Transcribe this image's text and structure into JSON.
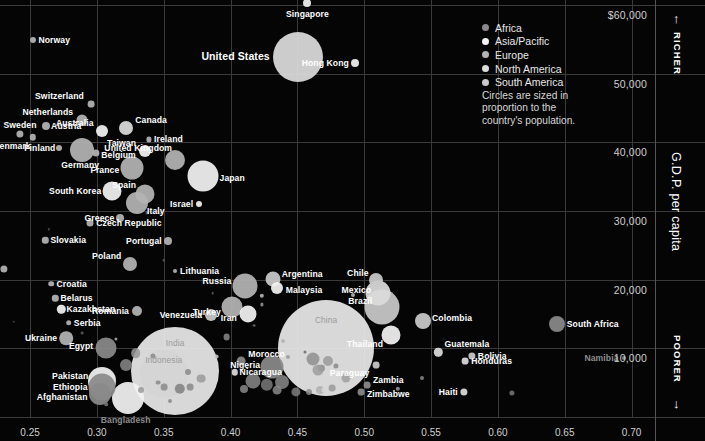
{
  "chart_data": {
    "type": "scatter",
    "title": "",
    "xlabel": "",
    "ylabel": "G.D.P. per capita",
    "xlim": [
      0.2275,
      0.7175
    ],
    "ylim": [
      0,
      60700
    ],
    "grid": true,
    "xticks": [
      0.25,
      0.3,
      0.35,
      0.4,
      0.45,
      0.5,
      0.55,
      0.6,
      0.65,
      0.7
    ],
    "xtick_labels": [
      "0.25",
      "0.30",
      "0.35",
      "0.40",
      "0.45",
      "0.50",
      "0.55",
      "0.60",
      "0.65",
      "0.70"
    ],
    "yticks": [
      60000,
      50000,
      40000,
      30000,
      20000,
      10000
    ],
    "ytick_labels": [
      "$60,000",
      "50,000",
      "40,000",
      "30,000",
      "20,000",
      "10,000"
    ],
    "y_axis_caption_top": "RICHER",
    "y_axis_caption_bottom": "POORER",
    "arrow_up": "↑",
    "arrow_down": "↓",
    "size_note": "Circles are sized in proportion to the country's population.",
    "legend_position": "top-right",
    "legend": [
      {
        "label": "Africa",
        "color": "#8a8a8a"
      },
      {
        "label": "Asia/Pacific",
        "color": "#f2f2f2"
      },
      {
        "label": "Europe",
        "color": "#b4b4b4"
      },
      {
        "label": "North America",
        "color": "#dcdcdc"
      },
      {
        "label": "South America",
        "color": "#c9c9c9"
      }
    ],
    "points": [
      {
        "name": "Singapore",
        "x": 0.4575,
        "y": 60200,
        "r": 4.0,
        "color": "#f2f2f2",
        "lx": 0,
        "ly": 11,
        "la": "c"
      },
      {
        "name": "Norway",
        "x": 0.2525,
        "y": 54900,
        "r": 3.0,
        "color": "#b4b4b4",
        "lx": 5,
        "ly": 0,
        "la": "l"
      },
      {
        "name": "United States",
        "x": 0.4503,
        "y": 52400,
        "r": 25.0,
        "color": "#dcdcdc",
        "lx": -28,
        "ly": -1,
        "la": "r",
        "big": true
      },
      {
        "name": "Hong Kong",
        "x": 0.493,
        "y": 51500,
        "r": 4.0,
        "color": "#f2f2f2",
        "lx": -6,
        "ly": 0,
        "la": "r"
      },
      {
        "name": "Switzerland",
        "x": 0.2955,
        "y": 45500,
        "r": 3.4,
        "color": "#b4b4b4",
        "lx": -7,
        "ly": -8,
        "la": "r"
      },
      {
        "name": "Netherlands",
        "x": 0.289,
        "y": 43300,
        "r": 5.5,
        "color": "#b4b4b4",
        "lx": -9,
        "ly": -8,
        "la": "r"
      },
      {
        "name": "Austria",
        "x": 0.262,
        "y": 42300,
        "r": 4.0,
        "color": "#b4b4b4",
        "lx": 5,
        "ly": 0,
        "la": "l"
      },
      {
        "name": "Australia",
        "x": 0.3035,
        "y": 41700,
        "r": 6.0,
        "color": "#f2f2f2",
        "lx": -8,
        "ly": -8,
        "la": "r"
      },
      {
        "name": "Canada",
        "x": 0.322,
        "y": 42000,
        "r": 7.0,
        "color": "#dcdcdc",
        "lx": 9,
        "ly": -8,
        "la": "l"
      },
      {
        "name": "Sweden",
        "x": 0.2425,
        "y": 41200,
        "r": 3.6,
        "color": "#b4b4b4",
        "lx": 0,
        "ly": -9,
        "la": "c"
      },
      {
        "name": "Denmark",
        "x": 0.252,
        "y": 40700,
        "r": 3.2,
        "color": "#b4b4b4",
        "lx": -2,
        "ly": 9,
        "la": "r"
      },
      {
        "name": "Ireland",
        "x": 0.339,
        "y": 40400,
        "r": 2.6,
        "color": "#b4b4b4",
        "lx": 5,
        "ly": 0,
        "la": "l"
      },
      {
        "name": "Finland",
        "x": 0.272,
        "y": 39100,
        "r": 3.0,
        "color": "#b4b4b4",
        "lx": -4,
        "ly": 0,
        "la": "r"
      },
      {
        "name": "Germany",
        "x": 0.289,
        "y": 38800,
        "r": 12.0,
        "color": "#b4b4b4",
        "lx": -2,
        "ly": 15,
        "la": "c"
      },
      {
        "name": "Belgium",
        "x": 0.2995,
        "y": 38400,
        "r": 3.6,
        "color": "#b4b4b4",
        "lx": 5,
        "ly": 2,
        "la": "l"
      },
      {
        "name": "Taiwan",
        "x": 0.336,
        "y": 38700,
        "r": 6.0,
        "color": "#f2f2f2",
        "lx": -9,
        "ly": -8,
        "la": "r"
      },
      {
        "name": "United Kingdom",
        "x": 0.3585,
        "y": 37400,
        "r": 10.0,
        "color": "#b4b4b4",
        "lx": -3,
        "ly": -12,
        "la": "r"
      },
      {
        "name": "France",
        "x": 0.3265,
        "y": 36300,
        "r": 11.5,
        "color": "#b4b4b4",
        "lx": -13,
        "ly": 2,
        "la": "r"
      },
      {
        "name": "Japan",
        "x": 0.379,
        "y": 35100,
        "r": 15.5,
        "color": "#f2f2f2",
        "lx": 17,
        "ly": 2,
        "la": "l"
      },
      {
        "name": "South Korea",
        "x": 0.3115,
        "y": 32900,
        "r": 9.5,
        "color": "#f2f2f2",
        "lx": -11,
        "ly": 0,
        "la": "r"
      },
      {
        "name": "Spain",
        "x": 0.336,
        "y": 32400,
        "r": 9.5,
        "color": "#b4b4b4",
        "lx": -9,
        "ly": -9,
        "la": "r"
      },
      {
        "name": "Italy",
        "x": 0.33,
        "y": 31100,
        "r": 11.0,
        "color": "#b4b4b4",
        "lx": 10,
        "ly": 8,
        "la": "l"
      },
      {
        "name": "Israel",
        "x": 0.3765,
        "y": 31000,
        "r": 3.0,
        "color": "#f2f2f2",
        "lx": -6,
        "ly": 0,
        "la": "r"
      },
      {
        "name": "Greece",
        "x": 0.3175,
        "y": 29000,
        "r": 4.0,
        "color": "#b4b4b4",
        "lx": -6,
        "ly": 0,
        "la": "r"
      },
      {
        "name": "Czech Republic",
        "x": 0.295,
        "y": 28300,
        "r": 3.5,
        "color": "#b4b4b4",
        "lx": 6,
        "ly": 0,
        "la": "l"
      },
      {
        "name": "Slovakia",
        "x": 0.2615,
        "y": 25700,
        "r": 3.2,
        "color": "#b4b4b4",
        "lx": 5,
        "ly": 0,
        "la": "l"
      },
      {
        "name": "Portugal",
        "x": 0.353,
        "y": 25600,
        "r": 4.0,
        "color": "#b4b4b4",
        "lx": -6,
        "ly": 0,
        "la": "r"
      },
      {
        "name": "Poland",
        "x": 0.325,
        "y": 22200,
        "r": 7.0,
        "color": "#b4b4b4",
        "lx": -9,
        "ly": -8,
        "la": "r"
      },
      {
        "name": "Hungary",
        "x": 0.2305,
        "y": 21500,
        "r": 3.6,
        "color": "#b4b4b4",
        "lx": -5,
        "ly": 0,
        "la": "r"
      },
      {
        "name": "Lithuania",
        "x": 0.3585,
        "y": 21300,
        "r": 2.0,
        "color": "#b4b4b4",
        "lx": 5,
        "ly": 0,
        "la": "l"
      },
      {
        "name": "Argentina",
        "x": 0.4315,
        "y": 20100,
        "r": 7.5,
        "color": "#c9c9c9",
        "lx": 9,
        "ly": -5,
        "la": "l"
      },
      {
        "name": "Chile",
        "x": 0.5085,
        "y": 19900,
        "r": 7.0,
        "color": "#c9c9c9",
        "lx": -7,
        "ly": -7,
        "la": "r"
      },
      {
        "name": "Croatia",
        "x": 0.266,
        "y": 19400,
        "r": 2.8,
        "color": "#b4b4b4",
        "lx": 5,
        "ly": 0,
        "la": "l"
      },
      {
        "name": "Russia",
        "x": 0.411,
        "y": 19100,
        "r": 12.5,
        "color": "#b4b4b4",
        "lx": -14,
        "ly": -5,
        "la": "r"
      },
      {
        "name": "Malaysia",
        "x": 0.4345,
        "y": 18800,
        "r": 6.0,
        "color": "#f2f2f2",
        "lx": 9,
        "ly": 2,
        "la": "l"
      },
      {
        "name": "Mexico",
        "x": 0.5105,
        "y": 18100,
        "r": 12.5,
        "color": "#dcdcdc",
        "lx": -7,
        "ly": -3,
        "la": "r"
      },
      {
        "name": "Belarus",
        "x": 0.269,
        "y": 17300,
        "r": 3.2,
        "color": "#b4b4b4",
        "lx": 5,
        "ly": 0,
        "la": "l"
      },
      {
        "name": "Brazil",
        "x": 0.5135,
        "y": 16000,
        "r": 17.5,
        "color": "#c9c9c9",
        "lx": -10,
        "ly": -6,
        "la": "r"
      },
      {
        "name": "Turkey",
        "x": 0.401,
        "y": 16000,
        "r": 10.5,
        "color": "#b4b4b4",
        "lx": -11,
        "ly": 5,
        "la": "r"
      },
      {
        "name": "Kazakhstan",
        "x": 0.2735,
        "y": 15700,
        "r": 4.2,
        "color": "#f2f2f2",
        "lx": 5,
        "ly": 0,
        "la": "l"
      },
      {
        "name": "Romania",
        "x": 0.33,
        "y": 15400,
        "r": 5.0,
        "color": "#b4b4b4",
        "lx": -8,
        "ly": 0,
        "la": "r"
      },
      {
        "name": "Iran",
        "x": 0.413,
        "y": 15000,
        "r": 8.5,
        "color": "#f2f2f2",
        "lx": -11,
        "ly": 4,
        "la": "r"
      },
      {
        "name": "Venezuela",
        "x": 0.3855,
        "y": 14800,
        "r": 6.0,
        "color": "#c9c9c9",
        "lx": -9,
        "ly": 0,
        "la": "r"
      },
      {
        "name": "Colombia",
        "x": 0.544,
        "y": 14000,
        "r": 8.0,
        "color": "#c9c9c9",
        "lx": 9,
        "ly": -3,
        "la": "l"
      },
      {
        "name": "Serbia",
        "x": 0.279,
        "y": 13700,
        "r": 2.8,
        "color": "#b4b4b4",
        "lx": 5,
        "ly": 0,
        "la": "l"
      },
      {
        "name": "South Africa",
        "x": 0.644,
        "y": 13600,
        "r": 8.0,
        "color": "#8a8a8a",
        "lx": 10,
        "ly": 0,
        "la": "l"
      },
      {
        "name": "Thailand",
        "x": 0.52,
        "y": 12000,
        "r": 9.5,
        "color": "#f2f2f2",
        "lx": -8,
        "ly": 9,
        "la": "r"
      },
      {
        "name": "Ukraine",
        "x": 0.277,
        "y": 11500,
        "r": 6.8,
        "color": "#b4b4b4",
        "lx": -9,
        "ly": 0,
        "la": "r"
      },
      {
        "name": "China",
        "x": 0.4715,
        "y": 10000,
        "r": 48.0,
        "color": "#e8e8e8",
        "lx": 0,
        "ly": -28,
        "la": "c",
        "inner": true
      },
      {
        "name": "Egypt",
        "x": 0.307,
        "y": 10100,
        "r": 10.5,
        "color": "#8a8a8a",
        "lx": -13,
        "ly": -2,
        "la": "r"
      },
      {
        "name": "Guatemala",
        "x": 0.5555,
        "y": 9400,
        "r": 4.2,
        "color": "#dcdcdc",
        "lx": 6,
        "ly": -8,
        "la": "l"
      },
      {
        "name": "Bolivia",
        "x": 0.5805,
        "y": 8900,
        "r": 3.6,
        "color": "#c9c9c9",
        "lx": 6,
        "ly": 0,
        "la": "l"
      },
      {
        "name": "Namibia",
        "x": 0.694,
        "y": 8600,
        "r": 2.0,
        "color": "#8a8a8a",
        "lx": -5,
        "ly": 0,
        "la": "r",
        "dim": true
      },
      {
        "name": "Honduras",
        "x": 0.5755,
        "y": 8100,
        "r": 3.4,
        "color": "#dcdcdc",
        "lx": 6,
        "ly": 0,
        "la": "l"
      },
      {
        "name": "India",
        "x": 0.3585,
        "y": 6700,
        "r": 44.0,
        "color": "#e8e8e8",
        "lx": 0,
        "ly": -28,
        "la": "c",
        "inner": true
      },
      {
        "name": "Morocco",
        "x": 0.408,
        "y": 8100,
        "r": 4.4,
        "color": "#8a8a8a",
        "lx": 7,
        "ly": -7,
        "la": "l"
      },
      {
        "name": "Nigeria",
        "x": 0.431,
        "y": 7300,
        "r": 11.5,
        "color": "#8a8a8a",
        "lx": -12,
        "ly": -2,
        "la": "r"
      },
      {
        "name": "Paraguay",
        "x": 0.509,
        "y": 7600,
        "r": 3.4,
        "color": "#c9c9c9",
        "lx": -7,
        "ly": 8,
        "la": "r"
      },
      {
        "name": "Indonesia",
        "x": 0.35,
        "y": 6300,
        "r": 24.0,
        "color": "#d4d4d4",
        "lx": 0,
        "ly": -14,
        "la": "c",
        "inner": true
      },
      {
        "name": "Nicaragua",
        "x": 0.403,
        "y": 6500,
        "r": 3.2,
        "color": "#dcdcdc",
        "lx": 5,
        "ly": 0,
        "la": "l"
      },
      {
        "name": "Zambia",
        "x": 0.502,
        "y": 4700,
        "r": 3.4,
        "color": "#8a8a8a",
        "lx": 6,
        "ly": -5,
        "la": "l"
      },
      {
        "name": "Pakistan",
        "x": 0.304,
        "y": 5300,
        "r": 14.0,
        "color": "#f2f2f2",
        "lx": -14,
        "ly": -5,
        "la": "r"
      },
      {
        "name": "Ethiopia",
        "x": 0.3035,
        "y": 4300,
        "r": 13.5,
        "color": "#8a8a8a",
        "lx": -14,
        "ly": 0,
        "la": "r"
      },
      {
        "name": "Afghanistan",
        "x": 0.302,
        "y": 3400,
        "r": 11.0,
        "color": "#8a8a8a",
        "lx": -12,
        "ly": 3,
        "la": "r"
      },
      {
        "name": "Zimbabwe",
        "x": 0.4975,
        "y": 3600,
        "r": 3.4,
        "color": "#8a8a8a",
        "lx": 6,
        "ly": 2,
        "la": "l"
      },
      {
        "name": "Haiti",
        "x": 0.5745,
        "y": 3700,
        "r": 3.6,
        "color": "#dcdcdc",
        "lx": -6,
        "ly": 0,
        "la": "r"
      },
      {
        "name": "Bangladesh",
        "x": 0.323,
        "y": 2800,
        "r": 16.0,
        "color": "#f2f2f2",
        "lx": -2,
        "ly": 22,
        "la": "c",
        "dim": true
      }
    ],
    "unlabeled_points": [
      {
        "x": 0.3375,
        "y": 29700,
        "r": 1.5,
        "color": "#6a6a6a"
      },
      {
        "x": 0.347,
        "y": 29600,
        "r": 1.4,
        "color": "#6a6a6a"
      },
      {
        "x": 0.264,
        "y": 27300,
        "r": 1.2,
        "color": "#4a4a4a"
      },
      {
        "x": 0.35,
        "y": 22800,
        "r": 1.3,
        "color": "#5a5a5a"
      },
      {
        "x": 0.3865,
        "y": 18000,
        "r": 1.3,
        "color": "#5a5a5a"
      },
      {
        "x": 0.238,
        "y": 13900,
        "r": 1.2,
        "color": "#4a4a4a"
      },
      {
        "x": 0.4235,
        "y": 17600,
        "r": 2.2,
        "color": "#c0c0c0"
      },
      {
        "x": 0.4235,
        "y": 16400,
        "r": 1.6,
        "color": "#9a9a9a"
      },
      {
        "x": 0.4175,
        "y": 13300,
        "r": 1.4,
        "color": "#7a7a7a"
      },
      {
        "x": 0.439,
        "y": 11000,
        "r": 2.0,
        "color": "#b0b0b0"
      },
      {
        "x": 0.397,
        "y": 11600,
        "r": 3.4,
        "color": "#8a8a8a"
      },
      {
        "x": 0.3895,
        "y": 8800,
        "r": 2.4,
        "color": "#c9c9c9"
      },
      {
        "x": 0.443,
        "y": 8800,
        "r": 2.0,
        "color": "#9a9a9a"
      },
      {
        "x": 0.456,
        "y": 9400,
        "r": 1.5,
        "color": "#6a6a6a"
      },
      {
        "x": 0.4725,
        "y": 8200,
        "r": 5.0,
        "color": "#9a9a9a"
      },
      {
        "x": 0.4615,
        "y": 8400,
        "r": 6.5,
        "color": "#8f8f8f"
      },
      {
        "x": 0.468,
        "y": 7100,
        "r": 3.2,
        "color": "#8a8a8a"
      },
      {
        "x": 0.4655,
        "y": 6900,
        "r": 5.5,
        "color": "#9d9d9d"
      },
      {
        "x": 0.4785,
        "y": 7400,
        "r": 2.6,
        "color": "#8a8a8a"
      },
      {
        "x": 0.486,
        "y": 5700,
        "r": 4.5,
        "color": "#a0a0a0"
      },
      {
        "x": 0.476,
        "y": 4200,
        "r": 3.4,
        "color": "#9a9a9a"
      },
      {
        "x": 0.467,
        "y": 4000,
        "r": 4.0,
        "color": "#b0b0b0"
      },
      {
        "x": 0.47,
        "y": 3900,
        "r": 2.6,
        "color": "#d8d8d8"
      },
      {
        "x": 0.459,
        "y": 3600,
        "r": 3.0,
        "color": "#8a8a8a"
      },
      {
        "x": 0.449,
        "y": 3700,
        "r": 4.6,
        "color": "#7f7f7f"
      },
      {
        "x": 0.4385,
        "y": 5100,
        "r": 7.0,
        "color": "#8a8a8a"
      },
      {
        "x": 0.4345,
        "y": 3900,
        "r": 4.4,
        "color": "#8a8a8a"
      },
      {
        "x": 0.427,
        "y": 4700,
        "r": 6.2,
        "color": "#7a7a7a"
      },
      {
        "x": 0.4165,
        "y": 5300,
        "r": 7.5,
        "color": "#8a8a8a"
      },
      {
        "x": 0.41,
        "y": 4100,
        "r": 4.0,
        "color": "#8a8a8a"
      },
      {
        "x": 0.378,
        "y": 5600,
        "r": 4.4,
        "color": "#9a9a9a"
      },
      {
        "x": 0.37,
        "y": 4400,
        "r": 3.4,
        "color": "#8a8a8a"
      },
      {
        "x": 0.368,
        "y": 6600,
        "r": 3.0,
        "color": "#8a8a8a"
      },
      {
        "x": 0.362,
        "y": 4100,
        "r": 5.2,
        "color": "#7f7f7f"
      },
      {
        "x": 0.35,
        "y": 4300,
        "r": 3.4,
        "color": "#8a8a8a"
      },
      {
        "x": 0.346,
        "y": 5000,
        "r": 2.4,
        "color": "#8a8a8a"
      },
      {
        "x": 0.342,
        "y": 8900,
        "r": 2.6,
        "color": "#8a8a8a"
      },
      {
        "x": 0.329,
        "y": 9300,
        "r": 4.8,
        "color": "#9a9a9a"
      },
      {
        "x": 0.3215,
        "y": 7600,
        "r": 6.0,
        "color": "#8a8a8a"
      },
      {
        "x": 0.333,
        "y": 4000,
        "r": 3.0,
        "color": "#9a9a9a"
      },
      {
        "x": 0.3145,
        "y": 11400,
        "r": 1.6,
        "color": "#b0b0b0"
      },
      {
        "x": 0.289,
        "y": 12200,
        "r": 1.4,
        "color": "#5a5a5a"
      },
      {
        "x": 0.525,
        "y": 4100,
        "r": 2.2,
        "color": "#9a9a9a"
      },
      {
        "x": 0.543,
        "y": 5700,
        "r": 2.0,
        "color": "#8a8a8a"
      },
      {
        "x": 0.6105,
        "y": 3500,
        "r": 2.6,
        "color": "#7a7a7a"
      },
      {
        "x": 0.4915,
        "y": 17700,
        "r": 2.0,
        "color": "#c0c0c0"
      },
      {
        "x": 0.3545,
        "y": 2400,
        "r": 2.0,
        "color": "#8a8a8a"
      },
      {
        "x": 0.307,
        "y": 1900,
        "r": 1.8,
        "color": "#7a7a7a"
      }
    ]
  }
}
